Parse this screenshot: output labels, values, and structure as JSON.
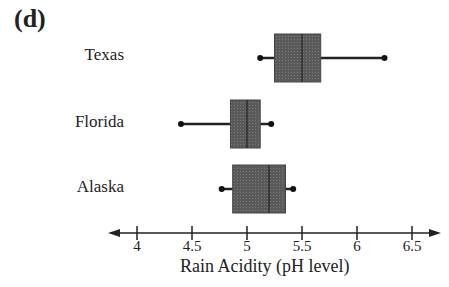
{
  "panel_label": "(d)",
  "chart_data": {
    "type": "boxplot",
    "orientation": "horizontal",
    "title": "",
    "xlabel": "Rain Acidity (pH level)",
    "ylabel": "",
    "xlim": [
      3.8,
      6.75
    ],
    "xticks": [
      4,
      4.5,
      5,
      5.5,
      6,
      6.5
    ],
    "xtick_labels": [
      "4",
      "4.5",
      "5",
      "5.5",
      "6",
      "6.5"
    ],
    "grid": false,
    "categories": [
      "Texas",
      "Florida",
      "Alaska"
    ],
    "series": [
      {
        "name": "Texas",
        "min": 5.12,
        "q1": 5.25,
        "median": 5.5,
        "q3": 5.67,
        "max": 6.25
      },
      {
        "name": "Florida",
        "min": 4.4,
        "q1": 4.85,
        "median": 5.0,
        "q3": 5.12,
        "max": 5.22
      },
      {
        "name": "Alaska",
        "min": 4.77,
        "q1": 4.87,
        "median": 5.2,
        "q3": 5.35,
        "max": 5.42
      }
    ],
    "box_color": "#5a5a5a",
    "line_color": "#222222"
  }
}
